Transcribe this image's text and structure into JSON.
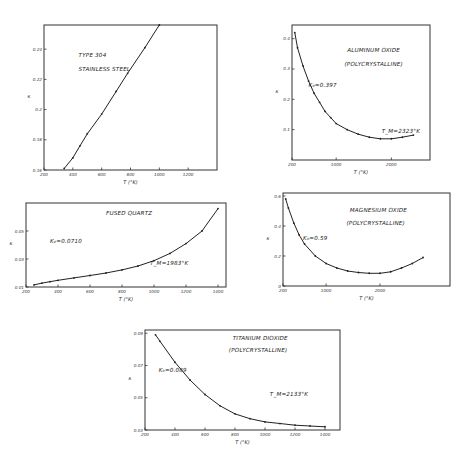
{
  "chart_data": [
    {
      "type": "line",
      "title": "TYPE 304 STAINLESS STEEL",
      "annotations": [
        "TYPE 304",
        "STAINLESS STEEL"
      ],
      "xlabel": "T (°K)",
      "ylabel": "κ",
      "xticks": [
        200,
        400,
        600,
        800,
        1000,
        1200
      ],
      "yticks": [
        0.16,
        0.18,
        0.2,
        0.22,
        0.24
      ],
      "xlim": [
        200,
        1400
      ],
      "ylim": [
        0.16,
        0.256
      ],
      "grid": false,
      "x": [
        340,
        400,
        450,
        500,
        600,
        700,
        780,
        900,
        1000
      ],
      "values": [
        0.161,
        0.168,
        0.176,
        0.184,
        0.197,
        0.212,
        0.224,
        0.241,
        0.256
      ],
      "frame": {
        "x0": 44,
        "x1": 217,
        "y0": 25,
        "y1": 170
      }
    },
    {
      "type": "line",
      "title": "ALUMINUM OXIDE (POLYCRYSTALLINE)",
      "annotations": [
        "ALUMINUM OXIDE",
        "(POLYCRYSTALLINE)",
        "K₀=0.397",
        "T_M=2323°K"
      ],
      "xlabel": "T (°K)",
      "ylabel": "κ",
      "xticks": [
        200,
        1000,
        2000
      ],
      "yticks": [
        0.1,
        0.2,
        0.3,
        0.4
      ],
      "xlim": [
        200,
        2700
      ],
      "ylim": [
        0.0,
        0.445
      ],
      "grid": false,
      "x": [
        250,
        300,
        400,
        500,
        600,
        700,
        800,
        900,
        1000,
        1200,
        1400,
        1600,
        1800,
        2000,
        2200,
        2400
      ],
      "values": [
        0.42,
        0.37,
        0.31,
        0.26,
        0.22,
        0.19,
        0.16,
        0.14,
        0.12,
        0.1,
        0.085,
        0.075,
        0.07,
        0.07,
        0.075,
        0.082
      ],
      "frame": {
        "x0": 292,
        "x1": 430,
        "y0": 25,
        "y1": 160
      }
    },
    {
      "type": "line",
      "title": "FUSED QUARTZ",
      "annotations": [
        "FUSED QUARTZ",
        "K₀=0.0710",
        "T_M=1983°K"
      ],
      "xlabel": "T (°K)",
      "ylabel": "κ",
      "xticks": [
        200,
        400,
        600,
        800,
        1000,
        1200,
        1400
      ],
      "yticks": [
        0.01,
        0.03,
        0.05
      ],
      "xlim": [
        200,
        1450
      ],
      "ylim": [
        0.01,
        0.07
      ],
      "grid": false,
      "x": [
        250,
        300,
        350,
        400,
        500,
        600,
        700,
        800,
        900,
        1000,
        1100,
        1200,
        1300,
        1400
      ],
      "values": [
        0.0115,
        0.0128,
        0.0138,
        0.0148,
        0.0165,
        0.0182,
        0.02,
        0.0222,
        0.025,
        0.0288,
        0.034,
        0.041,
        0.05,
        0.066
      ],
      "frame": {
        "x0": 26,
        "x1": 226,
        "y0": 203,
        "y1": 287
      }
    },
    {
      "type": "line",
      "title": "MAGNESIUM OXIDE (POLYCRYSTALLINE)",
      "annotations": [
        "MAGNESIUM OXIDE",
        "(POLYCRYSTALLINE)",
        "K₀=0.59"
      ],
      "xlabel": "T (°K)",
      "ylabel": "κ",
      "xticks": [
        200,
        1000,
        2000
      ],
      "yticks": [
        0.0,
        0.2,
        0.4,
        0.6
      ],
      "xlim": [
        200,
        3300
      ],
      "ylim": [
        0.0,
        0.62
      ],
      "grid": false,
      "x": [
        250,
        300,
        400,
        500,
        600,
        800,
        1000,
        1200,
        1400,
        1600,
        1800,
        2000,
        2200,
        2400,
        2600,
        2800
      ],
      "values": [
        0.58,
        0.52,
        0.42,
        0.34,
        0.28,
        0.2,
        0.15,
        0.12,
        0.1,
        0.09,
        0.085,
        0.085,
        0.095,
        0.12,
        0.15,
        0.19
      ],
      "frame": {
        "x0": 283,
        "x1": 450,
        "y0": 193,
        "y1": 286
      }
    },
    {
      "type": "line",
      "title": "TITANIUM DIOXIDE (POLYCRYSTALLINE)",
      "annotations": [
        "TITANIUM DIOXIDE",
        "(POLYCRYSTALLINE)",
        "K₀=0.089",
        "T_M=2133°K"
      ],
      "xlabel": "T (°K)",
      "ylabel": "κ",
      "xticks": [
        200,
        400,
        600,
        800,
        1000,
        1200,
        1400
      ],
      "yticks": [
        0.03,
        0.05,
        0.07,
        0.09
      ],
      "xlim": [
        200,
        1500
      ],
      "ylim": [
        0.03,
        0.092
      ],
      "grid": false,
      "x": [
        270,
        300,
        400,
        500,
        600,
        700,
        800,
        900,
        1000,
        1100,
        1200,
        1300,
        1400
      ],
      "values": [
        0.089,
        0.085,
        0.072,
        0.061,
        0.052,
        0.045,
        0.04,
        0.037,
        0.035,
        0.034,
        0.033,
        0.0325,
        0.032
      ],
      "frame": {
        "x0": 145,
        "x1": 340,
        "y0": 330,
        "y1": 430
      }
    }
  ]
}
